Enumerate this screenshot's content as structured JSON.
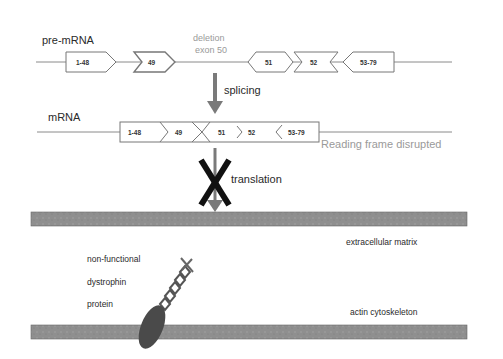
{
  "pre_mrna": {
    "label": "pre-mRNA",
    "deletion_label_line1": "deletion",
    "deletion_label_line2": "exon 50",
    "exons": [
      "1-48",
      "49",
      "51",
      "52",
      "53-79"
    ]
  },
  "splicing": {
    "label": "splicing"
  },
  "mrna": {
    "label": "mRNA",
    "exons": [
      "1-48",
      "49",
      "51",
      "52",
      "53-79"
    ],
    "note": "Reading frame disrupted"
  },
  "translation": {
    "label": "translation",
    "blocked": true
  },
  "membrane": {
    "top_label": "extracellular matrix",
    "bottom_label": "actin cytoskeleton"
  },
  "protein": {
    "line1": "non-functional",
    "line2": "dystrophin",
    "line3": "protein"
  },
  "colors": {
    "line": "#8a8a8a",
    "arrow": "#7a7a7a",
    "membrane": "#8f8f8f",
    "deletion_text": "#9a9a9a",
    "cross": "#111111",
    "protein_body": "#4a4a4a"
  }
}
